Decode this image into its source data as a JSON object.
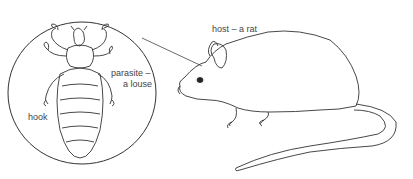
{
  "diagram": {
    "type": "illustration",
    "labels": {
      "host": "host – a rat",
      "parasite_line1": "parasite –",
      "parasite_line2": "a louse",
      "hook": "hook"
    },
    "colors": {
      "ink": "#333333",
      "background": "#ffffff"
    }
  }
}
